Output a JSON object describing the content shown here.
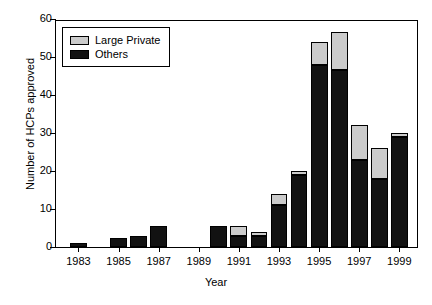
{
  "chart_data": {
    "type": "bar",
    "stacked": true,
    "title": "",
    "xlabel": "Year",
    "ylabel": "Number of HCPs approved",
    "ylim": [
      0,
      60
    ],
    "ytick_labels": [
      "0",
      "10",
      "20",
      "30",
      "40",
      "50",
      "60"
    ],
    "ytick_values": [
      0,
      10,
      20,
      30,
      40,
      50,
      60
    ],
    "xtick_labels": [
      "1983",
      "1985",
      "1987",
      "1989",
      "1991",
      "1993",
      "1995",
      "1997",
      "1999"
    ],
    "grid": false,
    "legend_position": "top-left",
    "categories": [
      "1983",
      "1984",
      "1985",
      "1986",
      "1987",
      "1988",
      "1989",
      "1990",
      "1991",
      "1992",
      "1993",
      "1994",
      "1995",
      "1996",
      "1997",
      "1998",
      "1999"
    ],
    "series": [
      {
        "name": "Others",
        "color": "#121212",
        "values": [
          1,
          0,
          2.5,
          3,
          5.5,
          0,
          0,
          5.5,
          3,
          3,
          11,
          19,
          48,
          46.5,
          23,
          18,
          29
        ]
      },
      {
        "name": "Large Private",
        "color": "#cbcbcb",
        "values": [
          0,
          0,
          0,
          0,
          0,
          0,
          0,
          0,
          2.5,
          1,
          3,
          1,
          6,
          10,
          9,
          8,
          1
        ]
      }
    ],
    "totals": [
      1,
      0,
      2.5,
      3,
      5.5,
      0,
      0,
      5.5,
      5.5,
      4,
      14,
      20,
      54,
      56.5,
      32,
      26,
      30
    ]
  },
  "legend": {
    "items": [
      {
        "label": "Large Private",
        "swatch": "large"
      },
      {
        "label": "Others",
        "swatch": "others"
      }
    ]
  }
}
